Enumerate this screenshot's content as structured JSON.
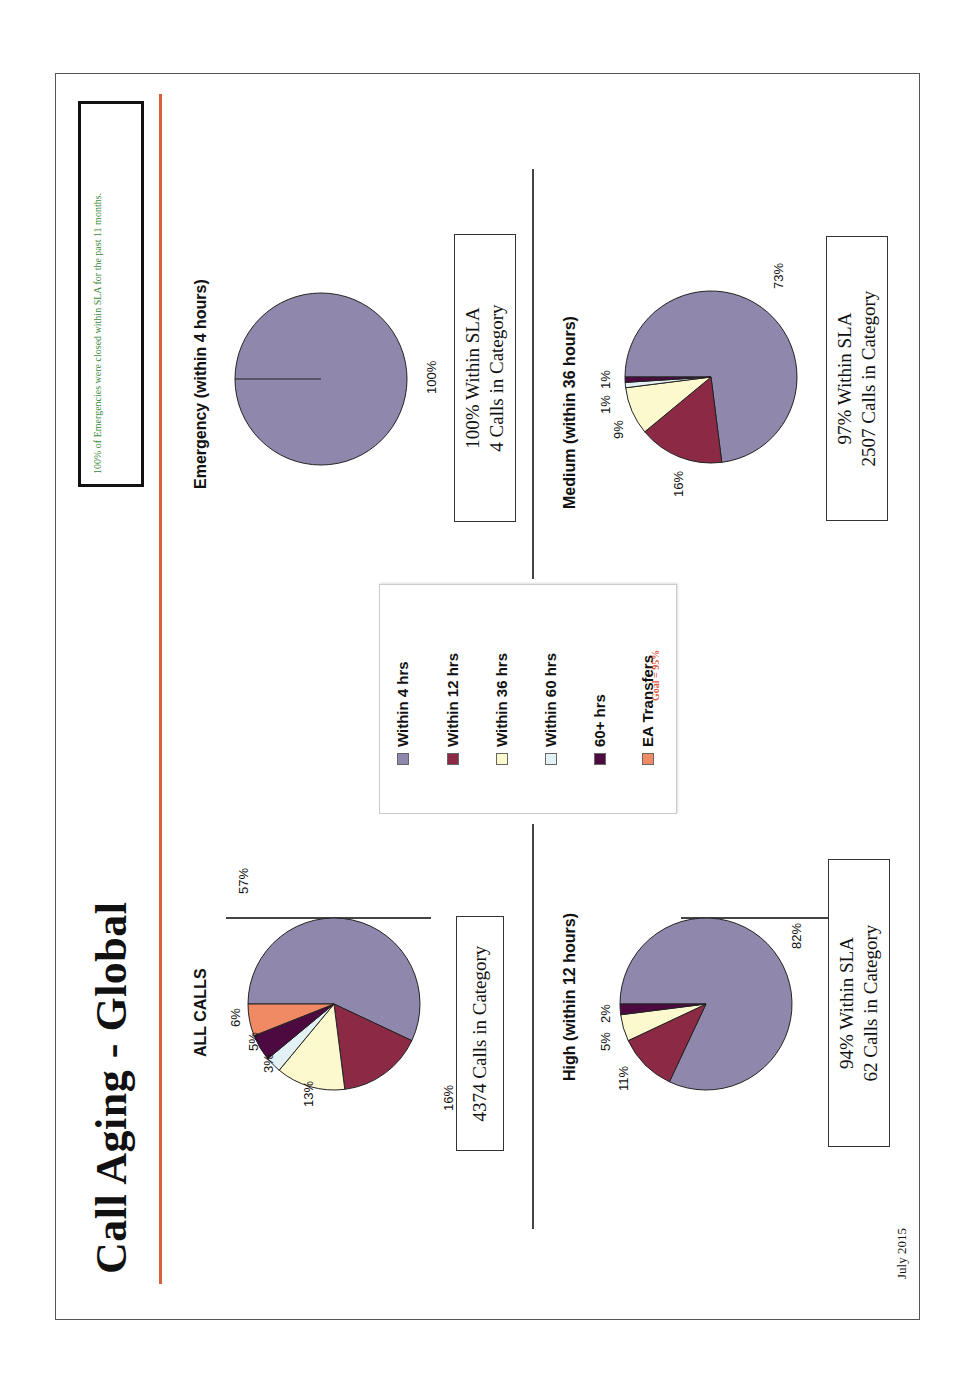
{
  "slide": {
    "title": "Call Aging - Global",
    "note": "100% of Emergencies were closed within SLA for the past 11 months.",
    "date": "July 2015",
    "orientation": "rotated 90° counter-clockwise"
  },
  "legend": {
    "items": [
      {
        "label": "Within 4 hrs",
        "color": "#9088ac"
      },
      {
        "label": "Within 12 hrs",
        "color": "#8c2a46"
      },
      {
        "label": "Within 36 hrs",
        "color": "#fdf9cf"
      },
      {
        "label": "Within 60 hrs",
        "color": "#e4f1f4"
      },
      {
        "label": "60+ hrs",
        "color": "#4c0a40"
      },
      {
        "label": "EA Transfers",
        "color": "#f08a64"
      }
    ],
    "goal": "Goal = 95%"
  },
  "pies": {
    "all": {
      "title": "ALL CALLS",
      "labels": [
        "57%",
        "16%",
        "13%",
        "3%",
        "5%",
        "6%"
      ],
      "box_line1": "4374 Calls in Category",
      "box_line2": ""
    },
    "emergency": {
      "title": "Emergency (within 4 hours)",
      "labels": [
        "100%"
      ],
      "box_line1": "100% Within SLA",
      "box_line2": "4 Calls in Category"
    },
    "high": {
      "title": "High (within 12 hours)",
      "labels": [
        "82%",
        "11%",
        "5%",
        "2%"
      ],
      "box_line1": "94% Within SLA",
      "box_line2": "62 Calls in Category"
    },
    "medium": {
      "title": "Medium (within 36 hours)",
      "labels": [
        "73%",
        "16%",
        "9%",
        "1%",
        "1%"
      ],
      "box_line1": "97% Within SLA",
      "box_line2": "2507 Calls in Category"
    }
  },
  "chart_data": [
    {
      "type": "pie",
      "title": "ALL CALLS",
      "categories": [
        "Within 4 hrs",
        "Within 12 hrs",
        "Within 36 hrs",
        "Within 60 hrs",
        "60+ hrs",
        "EA Transfers"
      ],
      "values": [
        57,
        16,
        13,
        3,
        5,
        6
      ],
      "annotation": "4374 Calls in Category"
    },
    {
      "type": "pie",
      "title": "Emergency (within 4 hours)",
      "categories": [
        "Within 4 hrs"
      ],
      "values": [
        100
      ],
      "annotation": "100% Within SLA; 4 Calls in Category"
    },
    {
      "type": "pie",
      "title": "High (within 12 hours)",
      "categories": [
        "Within 4 hrs",
        "Within 12 hrs",
        "Within 36 hrs",
        "60+ hrs"
      ],
      "values": [
        82,
        11,
        5,
        2
      ],
      "annotation": "94% Within SLA; 62 Calls in Category"
    },
    {
      "type": "pie",
      "title": "Medium (within 36 hours)",
      "categories": [
        "Within 4 hrs",
        "Within 12 hrs",
        "Within 36 hrs",
        "Within 60 hrs",
        "60+ hrs"
      ],
      "values": [
        73,
        16,
        9,
        1,
        1
      ],
      "annotation": "97% Within SLA; 2507 Calls in Category"
    }
  ]
}
